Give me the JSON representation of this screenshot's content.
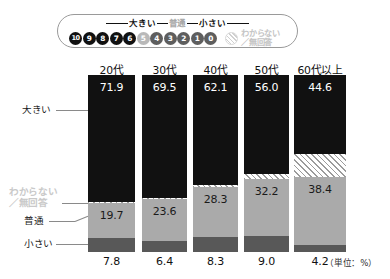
{
  "legend": {
    "scale_left_label": "大きい",
    "scale_mid_label": "普通",
    "scale_right_label": "小さい",
    "dots": [
      {
        "value": "10",
        "tone": "big"
      },
      {
        "value": "9",
        "tone": "big"
      },
      {
        "value": "8",
        "tone": "big"
      },
      {
        "value": "7",
        "tone": "big"
      },
      {
        "value": "6",
        "tone": "big"
      },
      {
        "value": "5",
        "tone": "mid"
      },
      {
        "value": "4",
        "tone": "small"
      },
      {
        "value": "3",
        "tone": "small"
      },
      {
        "value": "2",
        "tone": "small"
      },
      {
        "value": "1",
        "tone": "small"
      },
      {
        "value": "0",
        "tone": "small"
      }
    ],
    "na_label": "わからない\n／無回答"
  },
  "side_labels": {
    "big": "大きい",
    "na": "わからない\n／無回答",
    "mid": "普通",
    "small": "小さい"
  },
  "unit_note": "（単位：%）",
  "colors": {
    "big": "#111111",
    "mid": "#aaaaaa",
    "small": "#585858",
    "na_hatch": "#9b9b9b",
    "pill_border": "#9a9a9a",
    "faded_text": "#c9c9c9"
  },
  "chart_data": {
    "type": "bar",
    "title": "",
    "subtitle": "",
    "xlabel": "",
    "ylabel": "",
    "unit": "%",
    "stacked": true,
    "orientation": "vertical",
    "grid": false,
    "legend_position": "top",
    "ylim": [
      0,
      100
    ],
    "categories": [
      "20代",
      "30代",
      "40代",
      "50代",
      "60代以上"
    ],
    "series": [
      {
        "name": "大きい",
        "color": "#111111",
        "values": [
          71.9,
          69.5,
          62.1,
          56.0,
          44.6
        ]
      },
      {
        "name": "わからない／無回答",
        "color": "hatch",
        "values": [
          0.6,
          0.5,
          1.3,
          2.8,
          12.8
        ]
      },
      {
        "name": "普通",
        "color": "#aaaaaa",
        "values": [
          19.7,
          23.6,
          28.3,
          32.2,
          38.4
        ]
      },
      {
        "name": "小さい",
        "color": "#585858",
        "values": [
          7.8,
          6.4,
          8.3,
          9.0,
          4.2
        ]
      }
    ],
    "labels": {
      "big": [
        "71.9",
        "69.5",
        "62.1",
        "56.0",
        "44.6"
      ],
      "mid": [
        "19.7",
        "23.6",
        "28.3",
        "32.2",
        "38.4"
      ],
      "small": [
        "7.8",
        "6.4",
        "8.3",
        "9.0",
        "4.2"
      ]
    }
  }
}
